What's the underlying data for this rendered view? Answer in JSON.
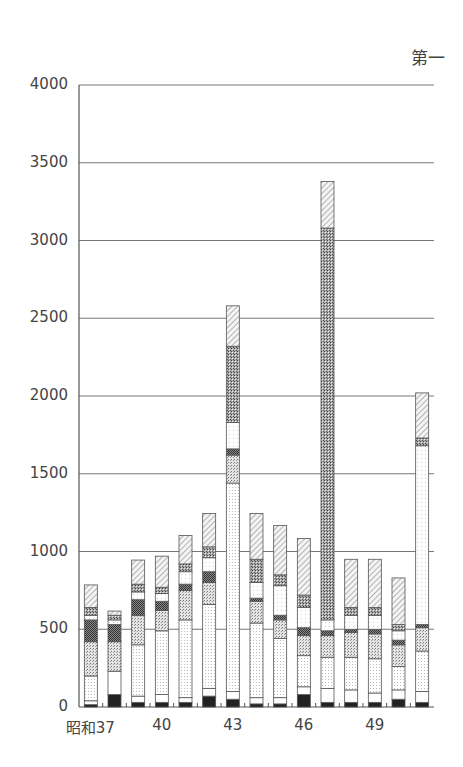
{
  "chart_data": {
    "type": "bar",
    "stacked": true,
    "title": "第一",
    "xlabel": "",
    "ylabel": "",
    "ylim": [
      0,
      4000
    ],
    "yticks": [
      0,
      500,
      1000,
      1500,
      2000,
      2500,
      3000,
      3500,
      4000
    ],
    "grid": true,
    "categories": [
      "昭和37",
      "38",
      "39",
      "40",
      "41",
      "42",
      "43",
      "44",
      "45",
      "46",
      "47",
      "48",
      "49",
      "50",
      "51"
    ],
    "x_tick_labels": [
      {
        "index": 0,
        "label": "昭和37"
      },
      {
        "index": 3,
        "label": "40"
      },
      {
        "index": 6,
        "label": "43"
      },
      {
        "index": 9,
        "label": "46"
      },
      {
        "index": 12,
        "label": "49"
      }
    ],
    "totals": [
      785,
      617,
      945,
      970,
      1103,
      1244,
      2580,
      1244,
      1167,
      1083,
      3380,
      950,
      950,
      830,
      2020
    ],
    "series": [
      {
        "name": "segment-1 (black)",
        "pattern": "solid-black",
        "values": [
          15,
          80,
          30,
          30,
          30,
          70,
          50,
          20,
          20,
          80,
          30,
          30,
          30,
          50,
          30
        ]
      },
      {
        "name": "segment-2 (white)",
        "pattern": "white",
        "values": [
          25,
          150,
          40,
          50,
          30,
          50,
          50,
          40,
          40,
          50,
          90,
          80,
          60,
          60,
          70
        ]
      },
      {
        "name": "segment-3 (light dots)",
        "pattern": "light-dots",
        "values": [
          160,
          0,
          330,
          410,
          500,
          540,
          1340,
          480,
          380,
          200,
          200,
          210,
          220,
          150,
          260
        ]
      },
      {
        "name": "segment-4 (medium dots)",
        "pattern": "medium-dots",
        "values": [
          220,
          190,
          190,
          130,
          190,
          140,
          180,
          140,
          120,
          130,
          140,
          160,
          160,
          140,
          150
        ]
      },
      {
        "name": "segment-5 (dark checker)",
        "pattern": "dark-checker",
        "values": [
          140,
          110,
          100,
          60,
          40,
          70,
          40,
          20,
          30,
          50,
          30,
          20,
          30,
          30,
          20
        ]
      },
      {
        "name": "segment-6 (white / fine dots)",
        "pattern": "white-dots",
        "values": [
          30,
          30,
          50,
          50,
          80,
          90,
          170,
          100,
          190,
          130,
          70,
          90,
          90,
          60,
          1150
        ]
      },
      {
        "name": "segment-7 (cross-hatch)",
        "pattern": "cross-hatch",
        "values": [
          50,
          30,
          50,
          40,
          50,
          70,
          490,
          150,
          70,
          80,
          2520,
          50,
          50,
          40,
          50
        ]
      },
      {
        "name": "segment-8 (diagonal hatch)",
        "pattern": "diagonal-hatch",
        "values": [
          145,
          27,
          155,
          200,
          183,
          214,
          260,
          294,
          317,
          363,
          300,
          310,
          310,
          300,
          290
        ]
      }
    ]
  }
}
